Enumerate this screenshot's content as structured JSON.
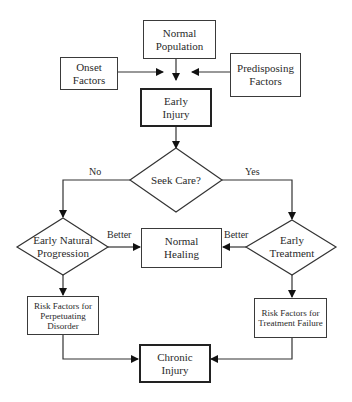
{
  "diagram": {
    "nodes": {
      "normal_population": "Normal Population",
      "onset_factors": "Onset Factors",
      "predisposing_factors": "Predisposing Factors",
      "early_injury": "Early Injury",
      "seek_care": "Seek Care?",
      "early_natural_progression": "Early Natural Progression",
      "early_treatment": "Early Treatment",
      "normal_healing": "Normal Healing",
      "risk_perpetuating": "Risk Factors for Perpetuating Disorder",
      "risk_treatment_failure": "Risk Factors for Treatment Failure",
      "chronic_injury": "Chronic Injury"
    },
    "edge_labels": {
      "no": "No",
      "yes": "Yes",
      "better_left": "Better",
      "better_right": "Better"
    }
  }
}
